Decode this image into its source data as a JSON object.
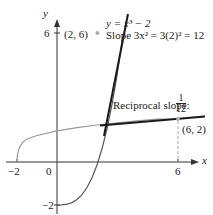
{
  "axes": {
    "x_label": "x",
    "y_label": "y",
    "x_ticks": [
      {
        "value": -2,
        "label": "−2"
      },
      {
        "value": 0,
        "label": "0"
      },
      {
        "value": 6,
        "label": "6"
      }
    ],
    "y_ticks": [
      {
        "value": 6,
        "label": "6"
      },
      {
        "value": -2,
        "label": "−2"
      }
    ]
  },
  "curves": {
    "cubic": {
      "equation": "y = x³ − 2",
      "color": "#555555"
    },
    "inverse": {
      "equation": "y = (x + 2)^(1/3)",
      "color": "#9a9a9a"
    }
  },
  "annotations": {
    "equation_label": "y = x³ − 2",
    "point1_label": "(2, 6)",
    "slope_label": "Slope 3x² = 3(2)² = 12",
    "reciprocal_prefix": "Reciprocal slope:",
    "reciprocal_num": "1",
    "reciprocal_den": "12",
    "point2_label": "(6, 2)"
  },
  "colors": {
    "axis": "#333333",
    "tangent": "#1a1a1a",
    "dashed": "#aaaaaa"
  }
}
